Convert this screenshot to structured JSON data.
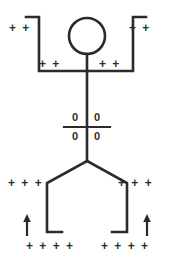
{
  "figure": {
    "background_color": "#ffffff",
    "stroke_color": "#2b2b2b",
    "text_color": "#2b2b2b",
    "stroke_width": 2.6,
    "labels": {
      "arm_left_outer": "+ +",
      "arm_right_outer": "+ +",
      "arm_left_inner": "+ +",
      "arm_right_inner": "+ +",
      "hip_left": "+ + +",
      "hip_right": "+ + +",
      "foot_left": "+ + + +",
      "foot_right": "+ + + +",
      "torso_zero_top_left": "0",
      "torso_zero_top_right": "0",
      "torso_zero_bottom_left": "0",
      "torso_zero_bottom_right": "0"
    },
    "parts": {
      "head": "circle",
      "left_arm": "bracket",
      "right_arm": "bracket",
      "torso": "vertical-line",
      "waist_divider": "horizontal-line",
      "left_leg": "angled-line",
      "right_leg": "angled-line",
      "left_foot": "horizontal-stub",
      "right_foot": "horizontal-stub",
      "left_arrow": "up-arrow",
      "right_arrow": "up-arrow"
    }
  }
}
